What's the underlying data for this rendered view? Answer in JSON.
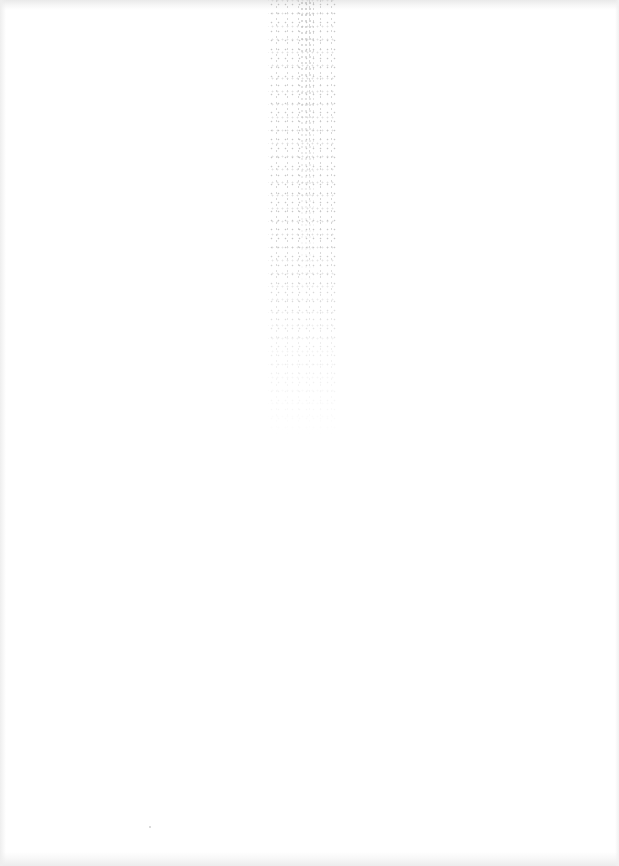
{
  "document": {
    "type": "blank scanned page",
    "text_content": "",
    "background_color": "#ffffff",
    "edge_shade_color": "#e9e9e9",
    "noise_color": "#9a9a9a"
  }
}
